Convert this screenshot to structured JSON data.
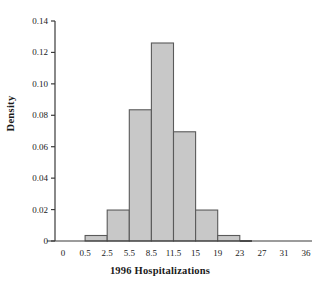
{
  "chart_data": {
    "type": "bar",
    "title": "",
    "xlabel": "1996 Hospitalizations",
    "ylabel": "Density",
    "grid": false,
    "legend": false,
    "bin_edges": [
      0.5,
      2.5,
      5.5,
      8.5,
      11.5,
      15,
      19,
      23
    ],
    "values": [
      0.0035,
      0.0197,
      0.0835,
      0.126,
      0.0695,
      0.0197,
      0.0035
    ],
    "categories": [
      "0.5-2.5",
      "2.5-5.5",
      "5.5-8.5",
      "8.5-11.5",
      "11.5-15",
      "15-19",
      "19-23"
    ],
    "xticks": [
      "0",
      "0.5",
      "2.5",
      "5.5",
      "8.5",
      "11.5",
      "15",
      "19",
      "23",
      "27",
      "31",
      "36"
    ],
    "xtick_values": [
      0,
      0.5,
      2.5,
      5.5,
      8.5,
      11.5,
      15,
      19,
      23,
      27,
      31,
      36
    ],
    "yticks": [
      "0",
      "0.02",
      "0.04",
      "0.06",
      "0.08",
      "0.10",
      "0.12",
      "0.14"
    ],
    "ytick_values": [
      0,
      0.02,
      0.04,
      0.06,
      0.08,
      0.1,
      0.12,
      0.14
    ],
    "ylim": [
      0,
      0.14
    ],
    "bar_fill_color": "#c8c8c8",
    "bar_edge_color": "#5a5a5a",
    "axis_color": "#3a3a3a"
  }
}
